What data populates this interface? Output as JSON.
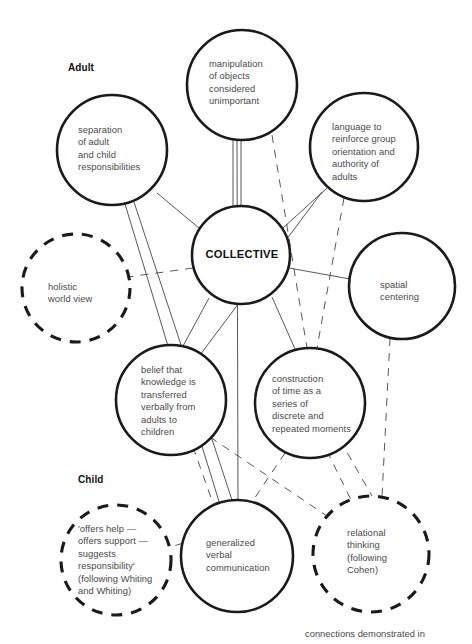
{
  "figure": {
    "caption": "connections demonstrated in",
    "caption_x": 305,
    "caption_y": 628,
    "background_color": "#ffffff",
    "ink_color": "#1a1a1a",
    "text_color": "#4a4a4a"
  },
  "group_labels": [
    {
      "id": "adult",
      "text": "Adult",
      "x": 68,
      "y": 62
    },
    {
      "id": "child",
      "text": "Child",
      "x": 78,
      "y": 474
    }
  ],
  "nodes": [
    {
      "id": "collective",
      "text": "COLLECTIVE",
      "style": "solid",
      "emphasis": "center",
      "cx": 241,
      "cy": 255,
      "r": 49,
      "text_x": 196,
      "text_y": 248,
      "text_w": 92,
      "text_align": "center"
    },
    {
      "id": "separation",
      "text": "separation\nof adult\nand child\nresponsibilities",
      "style": "solid",
      "emphasis": "normal",
      "cx": 112,
      "cy": 150,
      "r": 55,
      "text_x": 78,
      "text_y": 124,
      "text_w": 84,
      "text_align": "left"
    },
    {
      "id": "manipulation",
      "text": "manipulation\nof objects\nconsidered\nunimportant",
      "style": "solid",
      "emphasis": "normal",
      "cx": 242,
      "cy": 85,
      "r": 55,
      "text_x": 209,
      "text_y": 58,
      "text_w": 86,
      "text_align": "left"
    },
    {
      "id": "language",
      "text": "language to\nreinforce group\norientation and\nauthority of\nadults",
      "style": "solid",
      "emphasis": "normal",
      "cx": 364,
      "cy": 147,
      "r": 54,
      "text_x": 332,
      "text_y": 121,
      "text_w": 90,
      "text_align": "left"
    },
    {
      "id": "holistic",
      "text": "holistic\nworld view",
      "style": "dashed",
      "emphasis": "normal",
      "cx": 76,
      "cy": 288,
      "r": 54,
      "text_x": 48,
      "text_y": 281,
      "text_w": 76,
      "text_align": "left"
    },
    {
      "id": "spatial",
      "text": "spatial\ncentering",
      "style": "solid",
      "emphasis": "normal",
      "cx": 402,
      "cy": 286,
      "r": 53,
      "text_x": 380,
      "text_y": 279,
      "text_w": 70,
      "text_align": "left"
    },
    {
      "id": "belief",
      "text": "belief that\nknowledge is\ntransferred\nverbally from\nadults to\nchildren",
      "style": "solid",
      "emphasis": "normal",
      "cx": 171,
      "cy": 400,
      "r": 55,
      "text_x": 141,
      "text_y": 364,
      "text_w": 84,
      "text_align": "left"
    },
    {
      "id": "time",
      "text": "construction\nof time as a\nseries of\ndiscrete and\nrepeated moments",
      "style": "solid",
      "emphasis": "normal",
      "cx": 310,
      "cy": 403,
      "r": 55,
      "text_x": 272,
      "text_y": 373,
      "text_w": 96,
      "text_align": "left"
    },
    {
      "id": "offers",
      "text": "'offers help —\noffers support —\nsuggests\nresponsibility'\n(following Whiting\nand Whiting)",
      "style": "dashed",
      "emphasis": "normal",
      "cx": 116,
      "cy": 560,
      "r": 55,
      "text_x": 78,
      "text_y": 523,
      "text_w": 96,
      "text_align": "left"
    },
    {
      "id": "generalized",
      "text": "generalized\nverbal\ncommunication",
      "style": "solid",
      "emphasis": "normal",
      "cx": 237,
      "cy": 556,
      "r": 56,
      "text_x": 206,
      "text_y": 537,
      "text_w": 88,
      "text_align": "left"
    },
    {
      "id": "relational",
      "text": "relational\nthinking\n(following\nCohen)",
      "style": "dashed",
      "emphasis": "normal",
      "cx": 371,
      "cy": 554,
      "r": 58,
      "text_x": 347,
      "text_y": 527,
      "text_w": 76,
      "text_align": "left"
    }
  ],
  "links": [
    {
      "id": "collective-manipulation-a",
      "from": "collective",
      "to": "manipulation",
      "style": "solid",
      "x1": 233,
      "y1": 206,
      "x2": 233,
      "y2": 140
    },
    {
      "id": "collective-manipulation-b",
      "from": "collective",
      "to": "manipulation",
      "style": "solid",
      "x1": 241,
      "y1": 206,
      "x2": 241,
      "y2": 140
    },
    {
      "id": "collective-separation",
      "from": "collective",
      "to": "separation",
      "style": "solid",
      "x1": 199,
      "y1": 228,
      "x2": 157,
      "y2": 193
    },
    {
      "id": "collective-language",
      "from": "collective",
      "to": "language",
      "style": "solid",
      "x1": 283,
      "y1": 228,
      "x2": 327,
      "y2": 188
    },
    {
      "id": "collective-spatial",
      "from": "collective",
      "to": "spatial",
      "style": "solid",
      "x1": 289,
      "y1": 268,
      "x2": 350,
      "y2": 279
    },
    {
      "id": "collective-belief",
      "from": "collective",
      "to": "belief",
      "style": "solid",
      "x1": 209,
      "y1": 298,
      "x2": 183,
      "y2": 346
    },
    {
      "id": "collective-time",
      "from": "collective",
      "to": "time",
      "style": "solid",
      "x1": 272,
      "y1": 297,
      "x2": 295,
      "y2": 349
    },
    {
      "id": "collective-holistic",
      "from": "collective",
      "to": "holistic",
      "style": "dashed",
      "x1": 193,
      "y1": 268,
      "x2": 128,
      "y2": 277
    },
    {
      "id": "manipulation-time",
      "from": "manipulation",
      "to": "time",
      "style": "dashed",
      "x1": 272,
      "y1": 135,
      "x2": 307,
      "y2": 348
    },
    {
      "id": "language-time",
      "from": "language",
      "to": "time",
      "style": "dashed",
      "x1": 344,
      "y1": 198,
      "x2": 317,
      "y2": 348
    },
    {
      "id": "separation-generalized",
      "from": "separation",
      "to": "generalized",
      "style": "solid",
      "x1": 134,
      "y1": 202,
      "x2": 232,
      "y2": 500
    },
    {
      "id": "manipulation-generalized",
      "from": "manipulation",
      "to": "generalized",
      "style": "solid",
      "x1": 237,
      "y1": 140,
      "x2": 238,
      "y2": 500
    },
    {
      "id": "separation-belief",
      "from": "separation",
      "to": "belief",
      "style": "solid",
      "x1": 125,
      "y1": 204,
      "x2": 168,
      "y2": 346
    },
    {
      "id": "language-belief",
      "from": "language",
      "to": "belief",
      "style": "solid",
      "x1": 322,
      "y1": 192,
      "x2": 200,
      "y2": 355
    },
    {
      "id": "spatial-relational",
      "from": "spatial",
      "to": "relational",
      "style": "dashed",
      "x1": 390,
      "y1": 338,
      "x2": 382,
      "y2": 497
    },
    {
      "id": "belief-generalized-a",
      "from": "belief",
      "to": "generalized",
      "style": "dashed",
      "x1": 193,
      "y1": 447,
      "x2": 215,
      "y2": 509
    },
    {
      "id": "belief-generalized-b",
      "from": "belief",
      "to": "generalized",
      "style": "solid",
      "x1": 201,
      "y1": 443,
      "x2": 221,
      "y2": 508
    },
    {
      "id": "belief-relational",
      "from": "belief",
      "to": "relational",
      "style": "dashed",
      "x1": 210,
      "y1": 437,
      "x2": 327,
      "y2": 516
    },
    {
      "id": "time-generalized",
      "from": "time",
      "to": "generalized",
      "style": "dashed",
      "x1": 285,
      "y1": 453,
      "x2": 252,
      "y2": 502
    },
    {
      "id": "time-relational",
      "from": "time",
      "to": "relational",
      "style": "dashed",
      "x1": 327,
      "y1": 451,
      "x2": 352,
      "y2": 502
    },
    {
      "id": "time-relational-b",
      "from": "time",
      "to": "relational",
      "style": "dashed",
      "x1": 340,
      "y1": 440,
      "x2": 372,
      "y2": 496
    },
    {
      "id": "generalized-offers",
      "from": "generalized",
      "to": "offers",
      "style": "dashed",
      "x1": 183,
      "y1": 543,
      "x2": 171,
      "y2": 547
    }
  ]
}
